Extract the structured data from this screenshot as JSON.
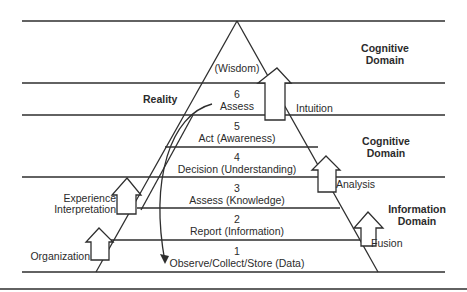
{
  "diagram": {
    "title": "",
    "colors": {
      "line": "#2e2e2e",
      "background": "#ffffff"
    },
    "levels": [
      {
        "number": "",
        "label": "(Wisdom)"
      },
      {
        "number": "6",
        "label": "Assess"
      },
      {
        "number": "5",
        "label": "Act (Awareness)"
      },
      {
        "number": "4",
        "label": "Decision (Understanding)"
      },
      {
        "number": "3",
        "label": "Assess (Knowledge)"
      },
      {
        "number": "2",
        "label": "Report (Information)"
      },
      {
        "number": "1",
        "label": "Observe/Collect/Store (Data)"
      }
    ],
    "domains": [
      {
        "line1": "Cognitive",
        "line2": "Domain"
      },
      {
        "line1": "Cognitive",
        "line2": "Domain"
      },
      {
        "line1": "Information",
        "line2": "Domain"
      }
    ],
    "reality_label": "Reality",
    "transitions": {
      "left": [
        {
          "line1": "Experience",
          "line2": "Interpretation"
        },
        {
          "line1": "Organization"
        }
      ],
      "right": [
        {
          "label": "Intuition"
        },
        {
          "label": "Analysis"
        },
        {
          "label": "Fusion"
        }
      ]
    }
  }
}
